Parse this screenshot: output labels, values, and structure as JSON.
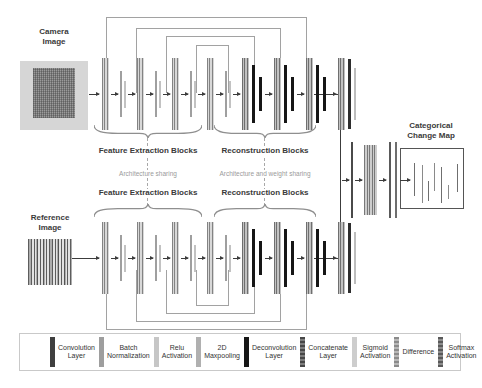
{
  "inputs": {
    "camera_label": "Camera\nImage",
    "reference_label": "Reference\nImage"
  },
  "branches": {
    "top": {
      "feature_label": "Feature Extraction Blocks",
      "reconstruction_label": "Reconstruction Blocks"
    },
    "bottom": {
      "feature_label": "Feature Extraction Blocks",
      "reconstruction_label": "Reconstruction Blocks"
    },
    "sharing_left": "Architecture sharing",
    "sharing_right": "Architecture and weight sharing"
  },
  "output": {
    "label": "Categorical\nChange Map"
  },
  "legend": {
    "items": [
      {
        "label": "Convolution\nLayer",
        "type": "conv"
      },
      {
        "label": "Batch\nNormalization",
        "type": "bn"
      },
      {
        "label": "Relu\nActivation",
        "type": "relu"
      },
      {
        "label": "2D\nMaxpooling",
        "type": "pool"
      },
      {
        "label": "Deconvolution\nLayer",
        "type": "deconv"
      },
      {
        "label": "Concatenate\nLayer",
        "type": "concat"
      },
      {
        "label": "Sigmoid\nActivation",
        "type": "sigmoid"
      },
      {
        "label": "Difference",
        "type": "diff"
      },
      {
        "label": "Softmax\nActivation",
        "type": "softmax"
      }
    ]
  },
  "diagram": {
    "branch_pattern": [
      "inarrow",
      "convbn",
      "arrow",
      "relu",
      "pool",
      "arrow",
      "convbn",
      "arrow",
      "relu",
      "pool",
      "arrow",
      "convbn",
      "arrow",
      "relu",
      "pool",
      "arrow",
      "convbn",
      "arrow",
      "relu",
      "pool",
      "arrow",
      "concat",
      "deconv",
      "deconvs",
      "arrow",
      "concat",
      "deconv",
      "deconvs",
      "arrow",
      "concat",
      "deconv",
      "deconvs",
      "arrow",
      "concat",
      "endconv",
      "endthin"
    ],
    "merge_pattern": [
      "arrow",
      "diffbar",
      "arrow",
      "mconcat",
      "arrow",
      "mthin",
      "mthin2",
      "outarrow"
    ],
    "map_lines": [
      {
        "x": 13,
        "y": 14,
        "h": 33
      },
      {
        "x": 21,
        "y": 16,
        "h": 38
      },
      {
        "x": 27,
        "y": 32,
        "h": 20
      },
      {
        "x": 33,
        "y": 14,
        "h": 28
      },
      {
        "x": 40,
        "y": 18,
        "h": 36
      },
      {
        "x": 47,
        "y": 36,
        "h": 14
      },
      {
        "x": 56,
        "y": 15,
        "h": 28
      }
    ],
    "colors": {
      "skip_line": "#a2a2a2",
      "flow_line": "#3c3c3c"
    }
  }
}
